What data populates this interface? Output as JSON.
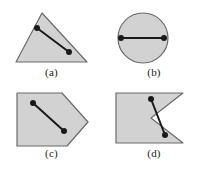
{
  "figure": {
    "background_color": "#ffffff",
    "shape_fill_color": "#d2d2d2",
    "shape_stroke_color": "#6b6b6b",
    "segment_color": "#1a1a1a",
    "point_color": "#1a1a1a",
    "caption_color": "#1a1a1a"
  },
  "panels": [
    {
      "id": "a",
      "caption": "(a)",
      "shape_name": "triangle",
      "shape_type": "polygon",
      "convex": true,
      "segment_inside": true,
      "polygon_points": "42,9 16,58 87,58",
      "points": [
        {
          "name": "point-1",
          "cx": 37,
          "cy": 24
        },
        {
          "name": "point-2",
          "cx": 69,
          "cy": 48
        }
      ],
      "segment": {
        "x1": 37,
        "y1": 24,
        "x2": 69,
        "y2": 48
      }
    },
    {
      "id": "b",
      "caption": "(b)",
      "shape_name": "circle",
      "shape_type": "circle",
      "convex": true,
      "segment_inside": true,
      "circle": {
        "cx": 40,
        "cy": 34,
        "r": 25
      },
      "points": [
        {
          "name": "point-1",
          "cx": 18,
          "cy": 34
        },
        {
          "name": "point-2",
          "cx": 61,
          "cy": 34
        }
      ],
      "segment": {
        "x1": 18,
        "y1": 34,
        "x2": 61,
        "y2": 34
      }
    },
    {
      "id": "c",
      "caption": "(c)",
      "shape_name": "pentagon",
      "shape_type": "polygon",
      "convex": true,
      "segment_inside": true,
      "polygon_points": "17,7 62,7 88,36 67,60 17,60",
      "points": [
        {
          "name": "point-1",
          "cx": 33,
          "cy": 17
        },
        {
          "name": "point-2",
          "cx": 64,
          "cy": 45
        }
      ],
      "segment": {
        "x1": 33,
        "y1": 17,
        "x2": 64,
        "y2": 45
      }
    },
    {
      "id": "d",
      "caption": "(d)",
      "shape_name": "notched-polygon",
      "shape_type": "polygon",
      "convex": false,
      "segment_inside": false,
      "polygon_points": "13,7 80,7 48,32 80,57 13,57",
      "points": [
        {
          "name": "point-1",
          "cx": 48,
          "cy": 13
        },
        {
          "name": "point-2",
          "cx": 62,
          "cy": 49
        }
      ],
      "segment": {
        "x1": 48,
        "y1": 13,
        "x2": 62,
        "y2": 49
      }
    }
  ]
}
